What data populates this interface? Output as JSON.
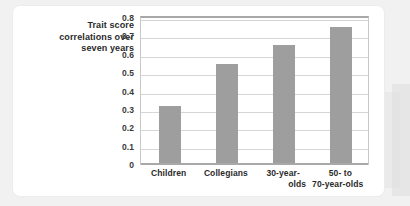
{
  "figure": {
    "caption_lines": [
      "Trait score",
      "correlations over",
      "seven years"
    ],
    "caption_text": "Trait score correlations over seven years"
  },
  "colors": {
    "bar": "#9e9e9e",
    "gridline": "#d6d6d6",
    "axis": "#a8a8a8",
    "card": "#ffffff",
    "page_background": "#f1f1f1",
    "text": "#2a2a2a"
  },
  "chart_data": {
    "type": "bar",
    "title": "",
    "subtitle": "",
    "xlabel": "",
    "ylabel": "Trait score correlations over seven years",
    "categories": [
      "Children",
      "Collegians",
      "30-year-olds",
      "50- to 70-year-olds"
    ],
    "category_label_lines": [
      [
        "Children"
      ],
      [
        "Collegians"
      ],
      [
        "30-year-",
        "olds"
      ],
      [
        "50-  to",
        "70-year-olds"
      ]
    ],
    "values": [
      0.31,
      0.54,
      0.64,
      0.74
    ],
    "ylim": [
      0,
      0.8
    ],
    "ytick_labels": [
      "0.8",
      "0.7",
      "0.6",
      "0.5",
      "0.4",
      "0.3",
      "0.2",
      "0.1",
      "0"
    ],
    "ytick_values": [
      0.8,
      0.7,
      0.6,
      0.5,
      0.4,
      0.3,
      0.2,
      0.1,
      0
    ],
    "grid": true,
    "legend": false,
    "legend_position": "none"
  }
}
